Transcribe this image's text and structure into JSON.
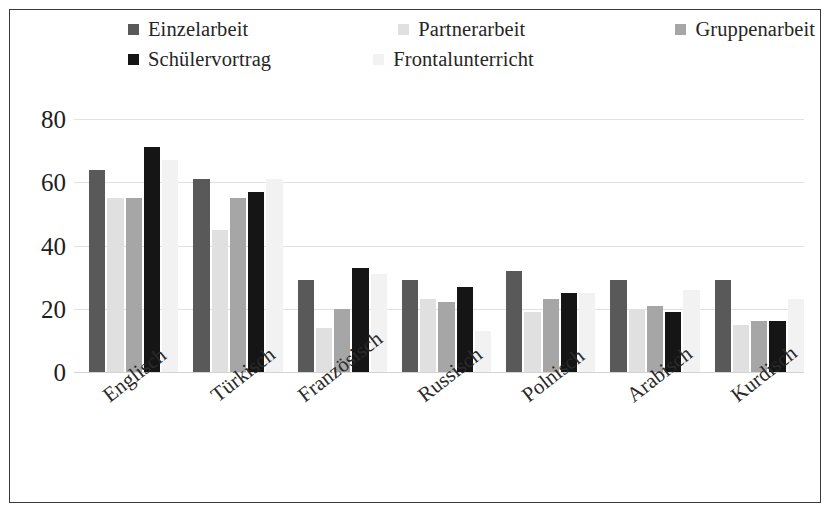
{
  "figure": {
    "frame_color": "#3a3a3a",
    "background": "#ffffff"
  },
  "legend": {
    "position": "top",
    "rows": [
      [
        {
          "label": "Einzelarbeit",
          "color": "#595959"
        },
        {
          "label": "Partnerarbeit",
          "color": "#e0e0e0"
        },
        {
          "label": "Gruppenarbeit",
          "color": "#a6a6a6"
        }
      ],
      [
        {
          "label": "Schülervortrag",
          "color": "#151515"
        },
        {
          "label": "Frontalunterricht",
          "color": "#f2f2f2"
        }
      ]
    ]
  },
  "axes": {
    "y_ticks": [
      80,
      60,
      40,
      20,
      0
    ],
    "y_min": 0,
    "y_max": 80,
    "x_label": "",
    "y_label": "",
    "grid": true
  },
  "chart_data": {
    "type": "bar",
    "title": "",
    "subtitle": "",
    "xlabel": "",
    "ylabel": "",
    "ylim": [
      0,
      80
    ],
    "grid": true,
    "legend_position": "top",
    "categories": [
      "Englisch",
      "Türkisch",
      "Französisch",
      "Russisch",
      "Polnisch",
      "Arabisch",
      "Kurdisch"
    ],
    "series": [
      {
        "name": "Einzelarbeit",
        "color": "#595959",
        "values": [
          64,
          61,
          29,
          29,
          32,
          29,
          29
        ]
      },
      {
        "name": "Partnerarbeit",
        "color": "#e0e0e0",
        "values": [
          55,
          45,
          14,
          23,
          19,
          20,
          15
        ]
      },
      {
        "name": "Gruppenarbeit",
        "color": "#a6a6a6",
        "values": [
          55,
          55,
          20,
          22,
          23,
          21,
          16
        ]
      },
      {
        "name": "Schülervortrag",
        "color": "#151515",
        "values": [
          71,
          57,
          33,
          27,
          25,
          19,
          16
        ]
      },
      {
        "name": "Frontalunterricht",
        "color": "#f2f2f2",
        "values": [
          67,
          61,
          31,
          13,
          25,
          26,
          23
        ]
      }
    ]
  }
}
